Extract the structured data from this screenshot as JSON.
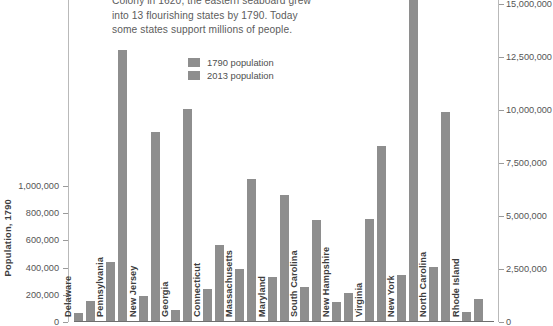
{
  "deck": {
    "lines": [
      "Colony in 1620, the eastern seaboard grew",
      "into 13 flourishing states by 1790. Today",
      "some states support millions of people."
    ]
  },
  "legend": {
    "position": "top-center",
    "items": [
      {
        "label": "1790 population",
        "color": "#8e8e8e"
      },
      {
        "label": "2013 population",
        "color": "#8e8e8e"
      }
    ]
  },
  "axes": {
    "left": {
      "title": "Population, 1790",
      "ticks": [
        "0",
        "200,000",
        "400,000",
        "600,000",
        "800,000",
        "1,000,000"
      ],
      "min": 0,
      "max": 1000000
    },
    "right": {
      "title": "",
      "ticks": [
        "0",
        "2,500,000",
        "5,000,000",
        "7,500,000",
        "10,000,000",
        "12,500,000",
        "15,000,000"
      ],
      "min": 0,
      "max": 15000000
    }
  },
  "chart_data": {
    "type": "bar",
    "title": "",
    "xlabel": "",
    "ylabel": "Population, 1790",
    "grid": false,
    "legend_position": "top-center",
    "categories": [
      "Delaware",
      "Pennsylvania",
      "New Jersey",
      "Georgia",
      "Connecticut",
      "Massachusetts",
      "Maryland",
      "South Carolina",
      "New Hampshire",
      "Virginia",
      "New York",
      "North Carolina",
      "Rhode Island"
    ],
    "series": [
      {
        "name": "1790 population",
        "color": "#8e8e8e",
        "axis": "left",
        "ylim": [
          0,
          1000000
        ],
        "values": [
          59000,
          434000,
          184000,
          83000,
          238000,
          379000,
          320000,
          249000,
          142000,
          748000,
          340000,
          394000,
          69000
        ]
      },
      {
        "name": "2013 population",
        "color": "#8e8e8e",
        "axis": "right",
        "ylim": [
          0,
          15000000
        ],
        "values": [
          925000,
          12770000,
          8900000,
          9990000,
          3600000,
          6690000,
          5930000,
          4770000,
          1320000,
          8260000,
          19650000,
          9850000,
          1050000
        ]
      }
    ]
  }
}
